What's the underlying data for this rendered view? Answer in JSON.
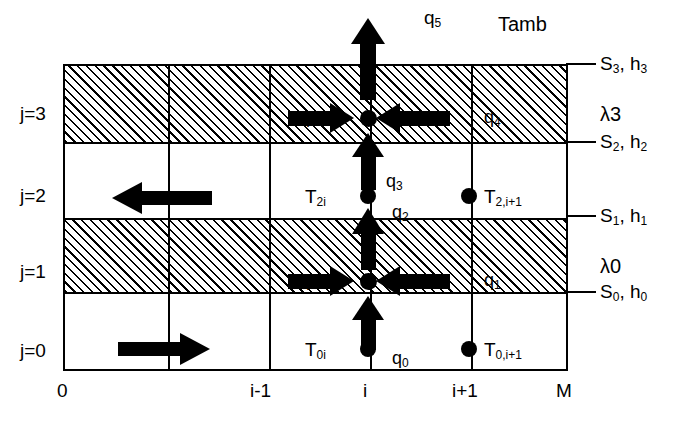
{
  "diagram": {
    "title_labels": {
      "ambient": "Tamb",
      "flux_top": "q5"
    },
    "row_labels": [
      {
        "id": "j3",
        "text": "j=3"
      },
      {
        "id": "j2",
        "text": "j=2"
      },
      {
        "id": "j1",
        "text": "j=1"
      },
      {
        "id": "j0",
        "text": "j=0"
      }
    ],
    "column_labels": [
      {
        "id": "c0",
        "text": "0"
      },
      {
        "id": "cim1",
        "text": "i-1"
      },
      {
        "id": "ci",
        "text": "i"
      },
      {
        "id": "cip1",
        "text": "i+1"
      },
      {
        "id": "cM",
        "text": "M"
      }
    ],
    "surface_labels": [
      {
        "id": "s3",
        "s": "S",
        "s_sub": "3",
        "h": "h",
        "h_sub": "3",
        "text": "S3, h3"
      },
      {
        "id": "s2",
        "s": "S",
        "s_sub": "2",
        "h": "h",
        "h_sub": "2",
        "text": "S2, h2"
      },
      {
        "id": "s1",
        "s": "S",
        "s_sub": "1",
        "h": "h",
        "h_sub": "1",
        "text": "S1, h1"
      },
      {
        "id": "s0",
        "s": "S",
        "s_sub": "0",
        "h": "h",
        "h_sub": "0",
        "text": "S0, h0"
      }
    ],
    "conductivity_labels": [
      {
        "id": "lambda3",
        "text": "λ3"
      },
      {
        "id": "lambda0",
        "text": "λ0"
      }
    ],
    "node_temperature_labels": [
      {
        "id": "T2i",
        "base": "T",
        "sub": "2i",
        "text": "T2i"
      },
      {
        "id": "T2ip1",
        "base": "T",
        "sub": "2,i+1",
        "text": "T2,i+1"
      },
      {
        "id": "T0i",
        "base": "T",
        "sub": "0i",
        "text": "T0i"
      },
      {
        "id": "T0ip1",
        "base": "T",
        "sub": "0,i+1",
        "text": "T0,i+1"
      }
    ],
    "flux_labels": [
      {
        "id": "q5",
        "base": "q",
        "sub": "5",
        "text": "q5"
      },
      {
        "id": "q4_left",
        "base": "q",
        "sub": "4",
        "text": "q4"
      },
      {
        "id": "q4_right",
        "base": "q",
        "sub": "4",
        "text": "q4"
      },
      {
        "id": "q3",
        "base": "q",
        "sub": "3",
        "text": "q3"
      },
      {
        "id": "q2",
        "base": "q",
        "sub": "2",
        "text": "q2"
      },
      {
        "id": "q1_left",
        "base": "q",
        "sub": "1",
        "text": "q1"
      },
      {
        "id": "q1_right",
        "base": "q",
        "sub": "1",
        "text": "q1"
      },
      {
        "id": "q0",
        "base": "q",
        "sub": "0",
        "text": "q0"
      }
    ],
    "colors": {
      "line": "#000000",
      "background": "#ffffff",
      "hatch": "#000000"
    }
  }
}
